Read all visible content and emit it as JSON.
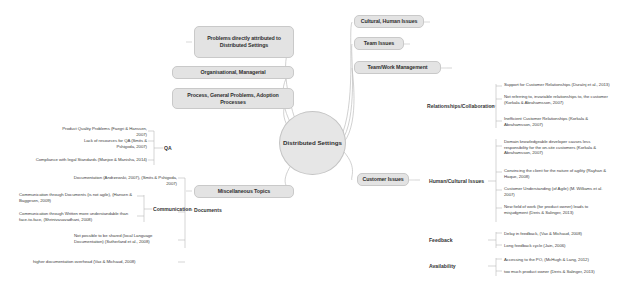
{
  "diagram": {
    "type": "mind-map",
    "central_node": "Distributed Settings",
    "left_branches": [
      {
        "label": "Problems directly attributed to Distributed Settings"
      },
      {
        "label": "Organisational, Managerial"
      },
      {
        "label": "Process, General Problems, Adoption Processes"
      },
      {
        "label": "Miscellaneous Topics"
      }
    ],
    "right_branches": [
      {
        "label": "Cultural, Human Issues"
      },
      {
        "label": "Team Issues"
      },
      {
        "label": "Team/Work Management"
      },
      {
        "label": "Customer Issues"
      }
    ],
    "left_categories": [
      {
        "name": "QA",
        "leaves": [
          "Product Quality Problems (Faegri & Hanssen, 2007)",
          "Lack of resources for QA (Smits & Pshigoda, 2007)",
          "Compliance with legal Standards (Manjoe & Manisha, 2014)"
        ]
      },
      {
        "name": "Documents",
        "leaves": [
          "Documentation (Andrzewski, 2007), (Smits & Pshigoda, 2007)"
        ]
      },
      {
        "name": "Communication",
        "leaves": [
          "Communication through Documents (is not agile), (Hansen & Baggesen, 2009)",
          "Communication through Written more understandable than face-to-face, (Shrinivasavadhani, 2008)"
        ]
      }
    ],
    "left_extra_leaves": [
      "Not possible to be shared  (local Language Documentation) (Sutherland et al., 2008)",
      "higher documentation overhead (Vax & Michaud, 2008)"
    ],
    "right_categories": [
      {
        "name": "Relationships/Collaboration",
        "leaves": [
          "Support for Customer Relationships (Duraínj et al., 2013)",
          "Not referring to, invariable relationships to, the customer (Korkala & Abrahamsson, 2007)",
          "Inefficient Customer Relationships (Korkala & Abrahamsson, 2007)"
        ]
      },
      {
        "name": "Human/Cultural Issues",
        "leaves": [
          "Domain knowledgeable developer causes less responsibility for the on-site customers (Korkala & Abrahamsson, 2007)",
          "Convincing the client for the nature of agility (Rayhan & Haque, 2008)",
          "Customer Understanding (of Agile) (M. Williams et al. 2007)",
          "New field of work (for product owner) leads to misjudgment (Deris & Salinger, 2013)"
        ]
      },
      {
        "name": "Feedback",
        "leaves": [
          "Delay in feedback, (Vax & Michaud, 2008)",
          "Long feedback cycle (Jain, 2006)"
        ]
      },
      {
        "name": "Availability",
        "leaves": [
          "Accessing to the PO, (McHugh & Lang, 2012)",
          "too much product owner (Deris & Salinger, 2013)"
        ]
      }
    ],
    "colors": {
      "node_fill": "#e3e3e3",
      "node_border": "#c9c9c9",
      "text": "#2f2f2f",
      "line": "#b4b4b4",
      "background": "#ffffff"
    }
  }
}
